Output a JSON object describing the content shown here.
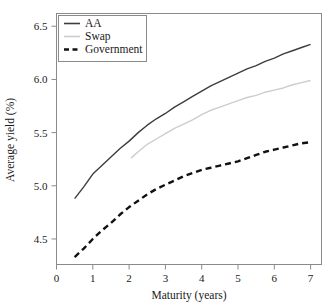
{
  "chart_data": {
    "type": "line",
    "title": "",
    "xlabel": "Maturity (years)",
    "ylabel": "Average yield (%)",
    "xlim": [
      0,
      7.3
    ],
    "ylim": [
      4.26,
      6.62
    ],
    "xticks": [
      0,
      1,
      2,
      3,
      4,
      5,
      6,
      7
    ],
    "xtick_labels": [
      "0",
      "1",
      "2",
      "3",
      "4",
      "5",
      "6",
      "7"
    ],
    "yticks": [
      4.5,
      5.0,
      5.5,
      6.0,
      6.5
    ],
    "ytick_labels": [
      "4.5",
      "5.0",
      "5.5",
      "6.0",
      "6.5"
    ],
    "grid": false,
    "legend_position": "top-left",
    "series": [
      {
        "name": "AA",
        "style": "solid",
        "color": "#3d3d3d",
        "x": [
          0.5,
          0.75,
          1.0,
          1.25,
          1.5,
          1.75,
          2.0,
          2.25,
          2.5,
          2.75,
          3.0,
          3.25,
          3.5,
          3.75,
          4.0,
          4.25,
          4.5,
          4.75,
          5.0,
          5.25,
          5.5,
          5.75,
          6.0,
          6.25,
          6.5,
          6.75,
          7.0
        ],
        "y": [
          4.88,
          4.99,
          5.11,
          5.19,
          5.27,
          5.35,
          5.42,
          5.5,
          5.57,
          5.63,
          5.68,
          5.74,
          5.79,
          5.84,
          5.89,
          5.94,
          5.98,
          6.02,
          6.06,
          6.1,
          6.13,
          6.17,
          6.2,
          6.24,
          6.27,
          6.3,
          6.33
        ]
      },
      {
        "name": "Swap",
        "style": "solid",
        "color": "#cdcdcd",
        "x": [
          2.05,
          2.25,
          2.5,
          2.75,
          3.0,
          3.25,
          3.5,
          3.75,
          4.0,
          4.25,
          4.5,
          4.75,
          5.0,
          5.25,
          5.5,
          5.75,
          6.0,
          6.25,
          6.5,
          6.75,
          7.0
        ],
        "y": [
          5.26,
          5.32,
          5.39,
          5.44,
          5.49,
          5.54,
          5.58,
          5.62,
          5.67,
          5.71,
          5.74,
          5.77,
          5.8,
          5.83,
          5.85,
          5.88,
          5.9,
          5.92,
          5.95,
          5.97,
          5.99
        ]
      },
      {
        "name": "Government",
        "style": "dashed",
        "color": "#111111",
        "x": [
          0.5,
          0.75,
          1.0,
          1.25,
          1.5,
          1.75,
          2.0,
          2.25,
          2.5,
          2.75,
          3.0,
          3.25,
          3.5,
          3.75,
          4.0,
          4.25,
          4.5,
          4.75,
          5.0,
          5.25,
          5.5,
          5.75,
          6.0,
          6.25,
          6.5,
          6.75,
          7.0
        ],
        "y": [
          4.33,
          4.41,
          4.5,
          4.58,
          4.65,
          4.73,
          4.8,
          4.86,
          4.92,
          4.97,
          5.01,
          5.05,
          5.09,
          5.12,
          5.15,
          5.17,
          5.19,
          5.21,
          5.23,
          5.26,
          5.29,
          5.32,
          5.34,
          5.36,
          5.38,
          5.4,
          5.41
        ]
      }
    ]
  },
  "legend": {
    "items": [
      {
        "label": "AA"
      },
      {
        "label": "Swap"
      },
      {
        "label": "Government"
      }
    ]
  }
}
